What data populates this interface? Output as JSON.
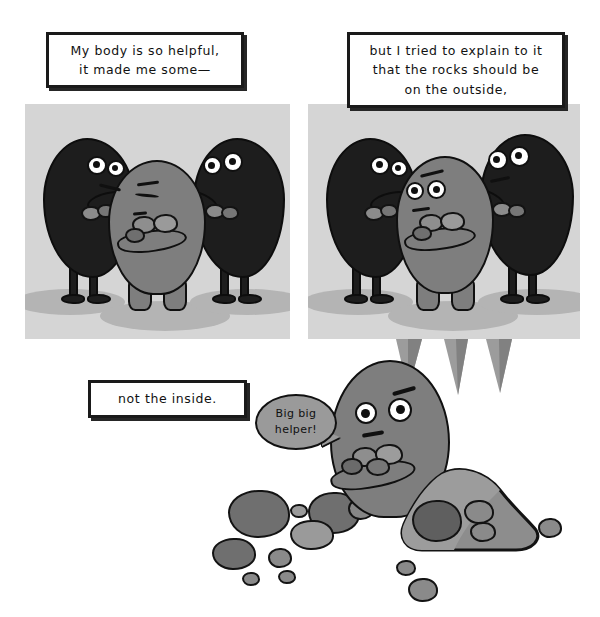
{
  "comic": {
    "title": "My body is so helpful",
    "page_size": {
      "width": 600,
      "height": 617
    },
    "background_color": "#ffffff",
    "panel_background_color": "#d5d5d5",
    "ink_color": "#101010",
    "character_gray": "#7e7e7e",
    "character_black": "#1d1d1d",
    "bubble_gray": "#9a9a9a",
    "panels": [
      {
        "id": "panel-1",
        "caption": "My body is so helpful,\nit made me some—",
        "characters": [
          "black-helper-left",
          "gray-protagonist",
          "black-helper-right"
        ]
      },
      {
        "id": "panel-2",
        "caption": "but I tried to explain to it\nthat the rocks should be\non the outside,",
        "characters": [
          "black-helper-left",
          "gray-protagonist",
          "black-helper-right"
        ]
      },
      {
        "id": "panel-3",
        "caption": "not the inside.",
        "speech_bubble": "Big big\nhelper!",
        "characters": [
          "gray-protagonist"
        ]
      }
    ]
  },
  "captions": {
    "one": "My body is so helpful,\nit made me some—",
    "two": "but I tried to explain to it\nthat the rocks should be\non the outside,",
    "three": "not the inside."
  },
  "speech": {
    "big_big_helper": "Big big\nhelper!"
  }
}
